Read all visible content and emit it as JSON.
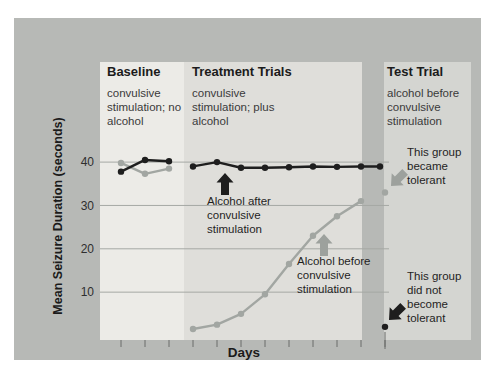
{
  "figure": {
    "y_axis_label": "Mean Seizure Duration (seconds)",
    "x_axis_label": "Days",
    "y_tick_labels": [
      "40",
      "30",
      "20",
      "10"
    ],
    "phases": [
      {
        "title": "Baseline",
        "description": "convulsive stimulation; no alcohol"
      },
      {
        "title": "Treatment Trials",
        "description": "convulsive stimulation; plus alcohol"
      },
      {
        "title": "Test Trial",
        "description": "alcohol before convulsive stimulation"
      }
    ],
    "annotations": [
      {
        "text": "Alcohol after convulsive stimulation",
        "arrow": "black-up-arrow"
      },
      {
        "text": "Alcohol before convulsive stimulation",
        "arrow": "gray-up-arrow"
      },
      {
        "text": "This group became tolerant",
        "arrow": "gray-diagonal-arrow"
      },
      {
        "text": "This group did not become tolerant",
        "arrow": "black-diagonal-arrow"
      }
    ],
    "colors": {
      "panel": "#b7b9b6",
      "baseline_band": "#ecebe7",
      "treatment_band": "#dfdeda",
      "test_band": "#d4d5d1",
      "gridline": "#a5a8a4",
      "tick": "#6a6d6a",
      "black_series": "#1e1e1e",
      "gray_series": "#a2a6a2",
      "gray_arrow": "#9da19d"
    }
  },
  "chart_data": {
    "type": "line",
    "xlabel": "Days",
    "ylabel": "Mean Seizure Duration (seconds)",
    "ylim": [
      0,
      45
    ],
    "y_ticks": [
      40,
      30,
      20,
      10
    ],
    "grid": "horizontal",
    "legend_position": "none",
    "phases": [
      {
        "name": "Baseline",
        "condition": "convulsive stimulation; no alcohol",
        "n_trials": 3
      },
      {
        "name": "Treatment Trials",
        "condition": "convulsive stimulation; plus alcohol",
        "n_trials": 8
      },
      {
        "name": "Test Trial",
        "condition": "alcohol before convulsive stimulation",
        "n_trials": 1
      }
    ],
    "series": [
      {
        "name": "Alcohol after convulsive stimulation",
        "color": "#1e1e1e",
        "baseline": [
          37.8,
          40.5,
          40.2
        ],
        "treatment": [
          39,
          40,
          38.7,
          38.7,
          38.8,
          39,
          38.9,
          39,
          39
        ],
        "test": 2,
        "outcome": "This group did not become tolerant"
      },
      {
        "name": "Alcohol before convulsive stimulation",
        "color": "#a2a6a2",
        "baseline": [
          39.8,
          37.3,
          38.5
        ],
        "treatment": [
          1.5,
          2.5,
          5,
          9.5,
          16.5,
          23,
          27.5,
          31
        ],
        "test": 33,
        "outcome": "This group became tolerant"
      }
    ]
  }
}
